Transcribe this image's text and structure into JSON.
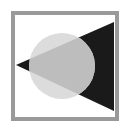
{
  "icon": {
    "name": "circle-triangle-overlap-icon",
    "colors": {
      "background": "#ffffff",
      "frame": "#9a9a9a",
      "circle": "#dcdcdc",
      "triangle": "#1a1a1a",
      "overlap": "#bdbdbd"
    }
  }
}
